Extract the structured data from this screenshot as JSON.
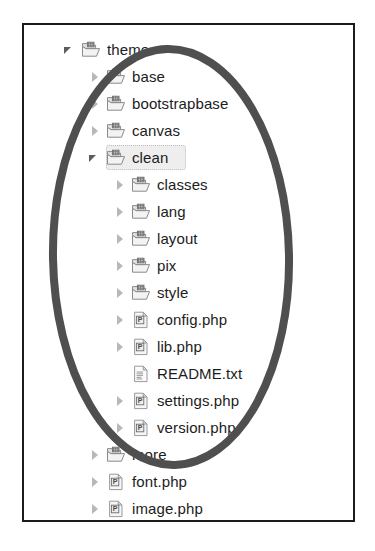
{
  "window": {
    "title": "File explorer tree view",
    "background_color": "#ffffff",
    "border_color": "#1b1b1b"
  },
  "annotation": {
    "shape": "ellipse",
    "stroke_color": "#4f4f4f",
    "stroke_width": 8,
    "description": "Hand drawn oval circling the clean theme folder contents"
  },
  "tree": {
    "selected_item": "clean",
    "items": [
      {
        "label": "theme",
        "depth": 0,
        "type": "folder",
        "state": "expanded",
        "selected": false
      },
      {
        "label": "base",
        "depth": 1,
        "type": "folder",
        "state": "collapsed",
        "selected": false
      },
      {
        "label": "bootstrapbase",
        "depth": 1,
        "type": "folder",
        "state": "collapsed",
        "selected": false
      },
      {
        "label": "canvas",
        "depth": 1,
        "type": "folder",
        "state": "collapsed",
        "selected": false
      },
      {
        "label": "clean",
        "depth": 1,
        "type": "folder",
        "state": "expanded",
        "selected": true
      },
      {
        "label": "classes",
        "depth": 2,
        "type": "folder",
        "state": "collapsed",
        "selected": false
      },
      {
        "label": "lang",
        "depth": 2,
        "type": "folder",
        "state": "collapsed",
        "selected": false
      },
      {
        "label": "layout",
        "depth": 2,
        "type": "folder",
        "state": "collapsed",
        "selected": false
      },
      {
        "label": "pix",
        "depth": 2,
        "type": "folder",
        "state": "collapsed",
        "selected": false
      },
      {
        "label": "style",
        "depth": 2,
        "type": "folder",
        "state": "collapsed",
        "selected": false
      },
      {
        "label": "config.php",
        "depth": 2,
        "type": "php",
        "state": "collapsed",
        "selected": false
      },
      {
        "label": "lib.php",
        "depth": 2,
        "type": "php",
        "state": "collapsed",
        "selected": false
      },
      {
        "label": "README.txt",
        "depth": 2,
        "type": "document",
        "state": "none",
        "selected": false
      },
      {
        "label": "settings.php",
        "depth": 2,
        "type": "php",
        "state": "collapsed",
        "selected": false
      },
      {
        "label": "version.php",
        "depth": 2,
        "type": "php",
        "state": "collapsed",
        "selected": false
      },
      {
        "label": "more",
        "depth": 1,
        "type": "folder",
        "state": "collapsed",
        "selected": false
      },
      {
        "label": "font.php",
        "depth": 1,
        "type": "php",
        "state": "collapsed",
        "selected": false
      },
      {
        "label": "image.php",
        "depth": 1,
        "type": "php",
        "state": "collapsed",
        "selected": false
      }
    ]
  },
  "icons": {
    "folder": "folder-icon",
    "php": "php-file-icon",
    "document": "text-document-icon",
    "expanded": "triangle-down-icon",
    "collapsed": "triangle-right-icon"
  }
}
